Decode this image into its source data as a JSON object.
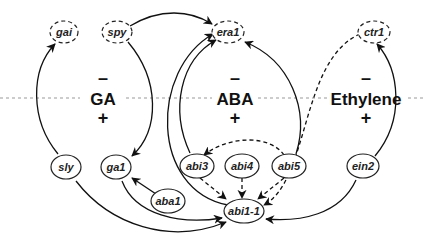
{
  "diagram": {
    "divider": {
      "style": "dashed",
      "color": "#999999"
    },
    "hormones": [
      {
        "id": "ga",
        "label": "GA",
        "minus": "–",
        "plus": "+"
      },
      {
        "id": "aba",
        "label": "ABA",
        "minus": "–",
        "plus": "+"
      },
      {
        "id": "ethylene",
        "label": "Ethylene",
        "minus": "–",
        "plus": "+"
      }
    ],
    "nodes": {
      "gai": {
        "label": "gai",
        "border": "dashed"
      },
      "spy": {
        "label": "spy",
        "border": "dashed"
      },
      "era1": {
        "label": "era1",
        "border": "dashed"
      },
      "ctr1": {
        "label": "ctr1",
        "border": "dashed"
      },
      "sly": {
        "label": "sly",
        "border": "solid"
      },
      "ga1": {
        "label": "ga1",
        "border": "solid"
      },
      "aba1": {
        "label": "aba1",
        "border": "solid"
      },
      "abi3": {
        "label": "abi3",
        "border": "solid"
      },
      "abi4": {
        "label": "abi4",
        "border": "solid"
      },
      "abi5": {
        "label": "abi5",
        "border": "solid"
      },
      "ein2": {
        "label": "ein2",
        "border": "solid"
      },
      "abi1_1": {
        "label": "abi1-1",
        "border": "solid"
      }
    },
    "edges": [
      {
        "from": "sly",
        "to": "gai",
        "style": "solid"
      },
      {
        "from": "spy",
        "to": "era1",
        "style": "solid"
      },
      {
        "from": "spy",
        "to": "ga1",
        "style": "solid"
      },
      {
        "from": "abi1_1",
        "to": "era1",
        "style": "solid"
      },
      {
        "from": "abi3",
        "to": "era1",
        "style": "solid"
      },
      {
        "from": "abi5",
        "to": "era1",
        "style": "solid"
      },
      {
        "from": "ein2",
        "to": "ctr1",
        "style": "solid"
      },
      {
        "from": "ctr1",
        "to": "abi1_1",
        "style": "dashed"
      },
      {
        "from": "abi5",
        "to": "abi3",
        "style": "dashed"
      },
      {
        "from": "abi3",
        "to": "abi1_1",
        "style": "dashed"
      },
      {
        "from": "abi4",
        "to": "abi1_1",
        "style": "dashed"
      },
      {
        "from": "abi5",
        "to": "abi1_1",
        "style": "dashed"
      },
      {
        "from": "aba1",
        "to": "ga1",
        "style": "solid"
      },
      {
        "from": "ga1",
        "to": "abi1_1",
        "style": "solid"
      },
      {
        "from": "sly",
        "to": "abi1_1",
        "style": "solid"
      },
      {
        "from": "ein2",
        "to": "abi1_1",
        "style": "solid"
      }
    ]
  }
}
